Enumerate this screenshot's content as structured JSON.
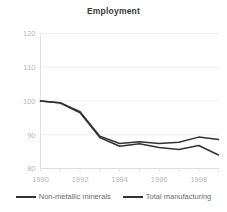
{
  "chart_data": {
    "type": "line",
    "title": "Employment",
    "xlabel": "",
    "ylabel": "",
    "x": [
      1990,
      1991,
      1992,
      1993,
      1994,
      1995,
      1996,
      1997,
      1998,
      1999
    ],
    "xlim": [
      1990,
      1999
    ],
    "ylim": [
      80,
      120
    ],
    "xticks": [
      1990,
      1992,
      1994,
      1996,
      1998
    ],
    "xtick_labels": [
      "1990",
      "1992",
      "1994",
      "1996",
      "1998"
    ],
    "yticks": [
      80,
      90,
      100,
      110,
      120
    ],
    "ytick_labels": [
      "80",
      "90",
      "100",
      "110",
      "120"
    ],
    "grid": true,
    "legend_position": "bottom",
    "series": [
      {
        "name": "Non-metallic minerals",
        "color": "#333333",
        "values": [
          100.0,
          99.4,
          96.5,
          89.2,
          86.6,
          87.3,
          86.2,
          85.6,
          86.8,
          84.0
        ]
      },
      {
        "name": "Total manufacturing",
        "color": "#333333",
        "values": [
          100.0,
          99.5,
          96.8,
          89.6,
          87.4,
          87.9,
          87.4,
          87.8,
          89.3,
          88.6
        ]
      }
    ]
  },
  "legend": {
    "items": [
      {
        "label": "Non-metallic minerals"
      },
      {
        "label": "Total manufacturing"
      }
    ]
  }
}
